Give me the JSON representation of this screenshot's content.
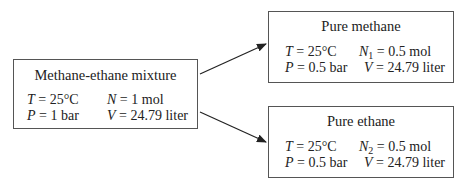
{
  "diagram": {
    "mixture": {
      "title": "Methane-ethane mixture",
      "T_var": "T",
      "T_val": " = 25°C",
      "N_var": "N",
      "N_val": " = 1 mol",
      "P_var": "P",
      "P_val": " = 1 bar",
      "V_var": "V",
      "V_val": " = 24.79 liter"
    },
    "methane": {
      "title": "Pure methane",
      "T_var": "T",
      "T_val": " = 25°C",
      "N_var": "N",
      "N_sub": "1",
      "N_val": " = 0.5 mol",
      "P_var": "P",
      "P_val": " = 0.5 bar",
      "V_var": "V",
      "V_val": " = 24.79 liter"
    },
    "ethane": {
      "title": "Pure ethane",
      "T_var": "T",
      "T_val": " = 25°C",
      "N_var": "N",
      "N_sub": "2",
      "N_val": " = 0.5 mol",
      "P_var": "P",
      "P_val": " = 0.5 bar",
      "V_var": "V",
      "V_val": " = 24.79 liter"
    },
    "arrow_color": "#222222",
    "border_color": "#555555"
  }
}
